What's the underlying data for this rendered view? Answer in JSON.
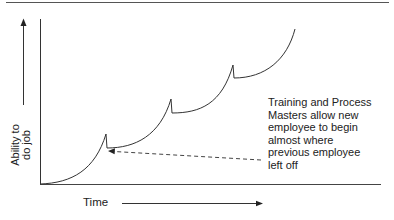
{
  "diagram": {
    "type": "learning-curve",
    "y_axis_label": [
      "Ability to",
      "do job"
    ],
    "x_axis_label": "Time",
    "annotation": [
      "Training and Process",
      "Masters allow new",
      "employee to begin",
      "almost where",
      "previous employee",
      "left off"
    ],
    "curve_segments": [
      {
        "start": [
          40,
          184
        ],
        "peak": [
          106,
          134
        ],
        "drop_to": [
          107,
          148
        ]
      },
      {
        "start": [
          107,
          148
        ],
        "peak": [
          171,
          99
        ],
        "drop_to": [
          172,
          113
        ]
      },
      {
        "start": [
          172,
          113
        ],
        "peak": [
          233,
          65
        ],
        "drop_to": [
          234,
          78
        ]
      },
      {
        "start": [
          234,
          78
        ],
        "end": [
          295,
          29
        ]
      }
    ],
    "colors": {
      "line": "#333333",
      "text": "#222222",
      "background": "#ffffff"
    }
  }
}
